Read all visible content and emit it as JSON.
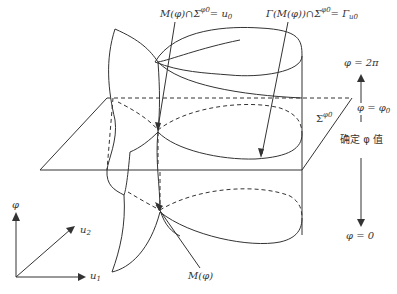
{
  "figure": {
    "labels": {
      "intersection_top": {
        "lhs": "M(φ)∩Σ",
        "sup": "φ0",
        "eq": "= u",
        "sub": "0"
      },
      "gamma_label": {
        "lhs": "Γ(M(φ))∩Σ",
        "sup": "φ0",
        "eq": "= Γ",
        "sub": "u0"
      },
      "sigma_plane": {
        "text": "Σ",
        "sup": "φ0"
      },
      "phi_2pi": "φ = 2π",
      "phi_phi0": {
        "text": "φ = φ",
        "sub": "0"
      },
      "fix_phi": "确定 φ 值",
      "phi_zero": "φ = 0",
      "manifold": "M(φ)",
      "axis_phi": "φ",
      "axis_u2": {
        "text": "u",
        "sub": "2"
      },
      "axis_u1": {
        "text": "u",
        "sub": "1"
      }
    },
    "colors": {
      "stroke": "#333333",
      "text": "#333333",
      "background": "#ffffff"
    }
  }
}
